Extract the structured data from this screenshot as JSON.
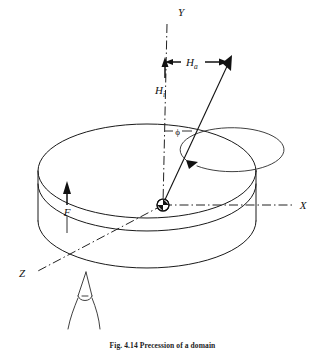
{
  "figure": {
    "caption": "Fig. 4.14  Precession of a domain",
    "background_color": "#ffffff",
    "line_color": "#1a1a1a"
  },
  "axes": [
    {
      "name": "y-axis",
      "label": "Y",
      "label_x": 181,
      "label_y": 16,
      "style": "dash-dot",
      "description": "vertical axis pointing up from origin"
    },
    {
      "name": "x-axis",
      "label": "X",
      "label_x": 303,
      "label_y": 205,
      "style": "dash-dot",
      "description": "horizontal axis pointing right from origin"
    },
    {
      "name": "z-axis",
      "label": "Z",
      "label_x": 22,
      "label_y": 273,
      "style": "dash-dot",
      "description": "oblique axis toward lower-left viewer"
    }
  ],
  "vectors": [
    {
      "name": "applied-field",
      "symbol": "H",
      "subscript": "a",
      "label_x": 189,
      "label_y": 64,
      "arrow": "horizontal-right",
      "description": "applied field component, horizontal arrow to resultant tip"
    },
    {
      "name": "internal-field",
      "symbol": "H",
      "subscript": "i",
      "label_x": 158,
      "label_y": 90,
      "arrow": "vertical-up",
      "description": "internal field component along Y"
    },
    {
      "name": "force",
      "symbol": "F",
      "subscript": "",
      "label_x": 70,
      "label_y": 212,
      "arrow": "vertical-up",
      "description": "force arrow on left face of disc"
    }
  ],
  "angle": {
    "name": "phi-angle",
    "symbol": "ϕ",
    "label_x": 176,
    "label_y": 132,
    "description": "angle between Y axis and resultant field vector"
  },
  "markers": [
    {
      "name": "origin-marker",
      "x": 163,
      "y": 205,
      "description": "hatched circle at coordinate origin on disc top surface"
    },
    {
      "name": "observer-eye",
      "x": 84,
      "y": 302,
      "description": "eye symbol indicating viewing direction along Z"
    }
  ],
  "shapes": [
    {
      "name": "disc-top-ellipse",
      "cx": 147,
      "cy": 171,
      "rx": 109,
      "ry": 47
    },
    {
      "name": "disc-bottom-arc",
      "cx": 147,
      "cy": 220,
      "rx": 109,
      "ry": 47
    },
    {
      "name": "precession-circle",
      "cx": 152,
      "cy": 178,
      "rx": 52,
      "ry": 22
    }
  ]
}
